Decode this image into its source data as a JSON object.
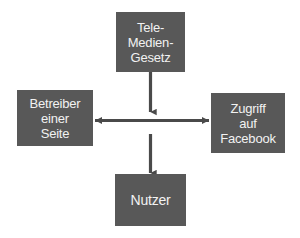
{
  "diagram": {
    "background_color": "#ffffff",
    "box_fill_color": "#585858",
    "box_text_color": "#f2f2f2",
    "arrow_color": "#4a4a4a",
    "nodes": [
      {
        "id": "tele-medien-gesetz",
        "position": "top",
        "lines": [
          "Tele-",
          "Medien-",
          "Gesetz"
        ]
      },
      {
        "id": "betreiber-einer-seite",
        "position": "left",
        "lines": [
          "Betreiber",
          "einer",
          "Seite"
        ]
      },
      {
        "id": "zugriff-auf-facebook",
        "position": "right",
        "lines": [
          "Zugriff",
          "auf",
          "Facebook"
        ]
      },
      {
        "id": "nutzer",
        "position": "bottom",
        "lines": [
          "Nutzer"
        ]
      }
    ],
    "connectors": [
      {
        "id": "gesetz-to-center",
        "from": "tele-medien-gesetz",
        "to": "center",
        "direction": "down",
        "heads": "single"
      },
      {
        "id": "betreiber-to-zugriff",
        "from": "betreiber-einer-seite",
        "to": "zugriff-auf-facebook",
        "direction": "horizontal",
        "heads": "double"
      },
      {
        "id": "center-to-nutzer",
        "from": "center",
        "to": "nutzer",
        "direction": "down",
        "heads": "single"
      }
    ]
  }
}
